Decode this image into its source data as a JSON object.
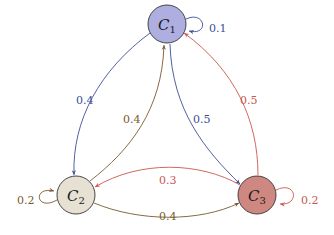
{
  "diagram": {
    "type": "markov-chain",
    "colors": {
      "blue": "#3b4f9a",
      "brown": "#7a5a2e",
      "red": "#c9574f"
    },
    "nodes": [
      {
        "id": "C1",
        "letter": "C",
        "sub": "1",
        "fill": "#aeaee0",
        "x": 167,
        "y": 24
      },
      {
        "id": "C2",
        "letter": "C",
        "sub": "2",
        "fill": "#e7e1d4",
        "x": 76,
        "y": 195
      },
      {
        "id": "C3",
        "letter": "C",
        "sub": "3",
        "fill": "#cf8781",
        "x": 257,
        "y": 195
      }
    ],
    "edges": [
      {
        "from": "C1",
        "to": "C1",
        "label": "0.1",
        "color": "blue"
      },
      {
        "from": "C1",
        "to": "C2",
        "label": "0.4",
        "color": "blue"
      },
      {
        "from": "C1",
        "to": "C3",
        "label": "0.5",
        "color": "blue"
      },
      {
        "from": "C2",
        "to": "C2",
        "label": "0.2",
        "color": "brown"
      },
      {
        "from": "C2",
        "to": "C1",
        "label": "0.4",
        "color": "brown"
      },
      {
        "from": "C2",
        "to": "C3",
        "label": "0.4",
        "color": "brown"
      },
      {
        "from": "C3",
        "to": "C3",
        "label": "0.2",
        "color": "red"
      },
      {
        "from": "C3",
        "to": "C1",
        "label": "0.5",
        "color": "red"
      },
      {
        "from": "C3",
        "to": "C2",
        "label": "0.3",
        "color": "red"
      }
    ]
  }
}
